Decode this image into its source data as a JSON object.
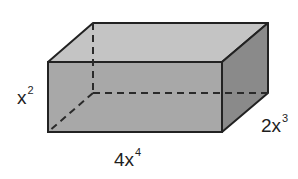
{
  "figure": {
    "type": "rectangular-prism",
    "colors": {
      "top_face": "#c4c4c4",
      "front_face": "#a8a8a8",
      "right_face": "#8a8a8a",
      "edge": "#222222",
      "hidden_edge": "#2a2a2a"
    },
    "labels": {
      "height": {
        "coef": "",
        "var": "x",
        "exp": "2"
      },
      "depth": {
        "coef": "2",
        "var": "x",
        "exp": "3"
      },
      "length": {
        "coef": "4",
        "var": "x",
        "exp": "4"
      }
    }
  }
}
